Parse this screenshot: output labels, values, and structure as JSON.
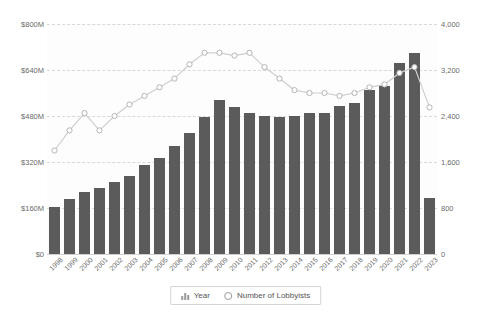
{
  "legend": {
    "position": "bottom",
    "items": [
      {
        "label": "Year",
        "icon": "bar-icon",
        "type": "bar"
      },
      {
        "label": "Number of Lobbyists",
        "icon": "circle-marker-icon",
        "type": "line"
      }
    ]
  },
  "colors": {
    "bar": "#5b5b5b",
    "line": "#cfcfcf",
    "marker_fill": "#ffffff",
    "marker_stroke": "#b5b5b5",
    "grid": "#d8d8d8",
    "text": "#6a6a6a",
    "plot_background": "#fdfdfd"
  },
  "chart_data": {
    "type": "bar",
    "title": "",
    "xlabel": "",
    "ylabel": "",
    "grid": true,
    "categories": [
      "1998",
      "1999",
      "2000",
      "2001",
      "2002",
      "2003",
      "2004",
      "2005",
      "2006",
      "2007",
      "2008",
      "2009",
      "2010",
      "2011",
      "2012",
      "2013",
      "2014",
      "2015",
      "2016",
      "2017",
      "2018",
      "2019",
      "2020",
      "2021",
      "2022",
      "2023"
    ],
    "left_axis": {
      "label": "",
      "ticks": [
        "$0",
        "$160M",
        "$320M",
        "$480M",
        "$640M",
        "$800M"
      ],
      "tick_values": [
        0,
        160000000,
        320000000,
        480000000,
        640000000,
        800000000
      ],
      "ylim": [
        0,
        800000000
      ]
    },
    "right_axis": {
      "label": "",
      "ticks": [
        "0",
        "800",
        "1,600",
        "2,400",
        "3,200",
        "4,000"
      ],
      "tick_values": [
        0,
        800,
        1600,
        2400,
        3200,
        4000
      ],
      "ylim": [
        0,
        4000
      ]
    },
    "series": [
      {
        "name": "Year",
        "type": "bar",
        "axis": "left",
        "unit": "USD",
        "values": [
          165000000,
          190000000,
          215000000,
          230000000,
          250000000,
          270000000,
          310000000,
          335000000,
          375000000,
          420000000,
          475000000,
          535000000,
          510000000,
          490000000,
          480000000,
          478000000,
          480000000,
          490000000,
          490000000,
          515000000,
          525000000,
          570000000,
          585000000,
          665000000,
          700000000,
          195000000
        ]
      },
      {
        "name": "Number of Lobbyists",
        "type": "line",
        "axis": "right",
        "unit": "lobbyists",
        "values": [
          1800,
          2150,
          2450,
          2150,
          2400,
          2600,
          2750,
          2900,
          3050,
          3300,
          3500,
          3500,
          3450,
          3500,
          3250,
          3050,
          2850,
          2800,
          2800,
          2750,
          2800,
          2900,
          2950,
          3150,
          3250,
          2550
        ]
      }
    ]
  }
}
